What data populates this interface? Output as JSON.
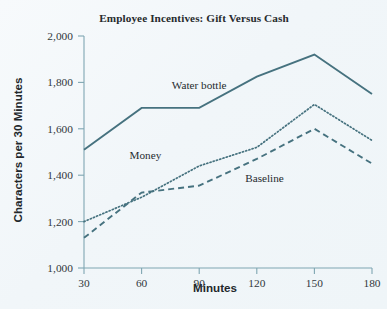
{
  "chart_data": {
    "type": "line",
    "title": "Employee Incentives: Gift Versus Cash",
    "xlabel": "Minutes",
    "ylabel": "Characters per 30 Minutes",
    "x": [
      30,
      60,
      90,
      120,
      150,
      180
    ],
    "xticklabels": [
      "30",
      "60",
      "90",
      "120",
      "150",
      "180"
    ],
    "yticks": [
      1000,
      1200,
      1400,
      1600,
      1800,
      2000
    ],
    "yticklabels": [
      "1,000",
      "1,200",
      "1,400",
      "1,600",
      "1,800",
      "2,000"
    ],
    "xlim": [
      30,
      180
    ],
    "ylim": [
      1000,
      2000
    ],
    "grid": false,
    "legend_position": "inline-annotations",
    "line_color": "#46727f",
    "background_color": "#f3f7fa",
    "series": [
      {
        "name": "Water bottle",
        "style": "solid",
        "label_x": 90,
        "label_y": 1770,
        "values": [
          1510,
          1690,
          1690,
          1825,
          1920,
          1750
        ]
      },
      {
        "name": "Money",
        "style": "dotted",
        "label_x": 62,
        "label_y": 1470,
        "values": [
          1200,
          1305,
          1440,
          1520,
          1705,
          1550
        ]
      },
      {
        "name": "Baseline",
        "style": "dashed",
        "label_x": 124,
        "label_y": 1370,
        "values": [
          1130,
          1325,
          1355,
          1470,
          1600,
          1450
        ]
      }
    ]
  }
}
